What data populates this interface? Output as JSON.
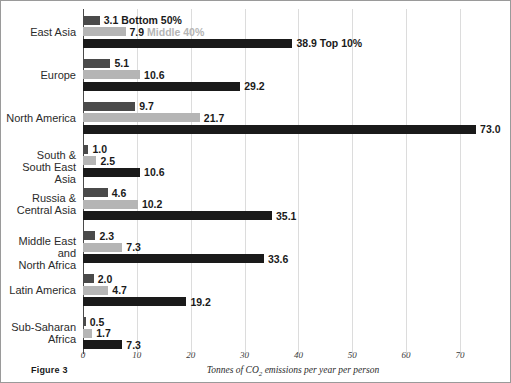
{
  "figure": {
    "caption": "Figure 3",
    "x_axis_title_prefix": "Tonnes of CO",
    "x_axis_title_sub": "2",
    "x_axis_title_suffix": " emissions per year per person"
  },
  "legend": {
    "bottom_label": "Bottom 50%",
    "middle_label": "Middle 40%",
    "top_label": "Top 10%",
    "bottom_color": "#4a4a4a",
    "middle_color": "#b5b5b5",
    "top_color": "#1a1a1a"
  },
  "chart_data": {
    "type": "bar",
    "orientation": "horizontal",
    "title": "",
    "xlabel": "Tonnes of CO2 emissions per year per person",
    "ylabel": "",
    "xlim": [
      0,
      78
    ],
    "xticks": [
      0,
      10,
      20,
      30,
      40,
      50,
      60,
      70
    ],
    "xtick_labels": [
      "0",
      "10",
      "20",
      "30",
      "40",
      "50",
      "60",
      "70"
    ],
    "grid": true,
    "legend_position": "inline-top-first-group",
    "categories": [
      "East Asia",
      "Europe",
      "North America",
      "South &\nSouth East Asia",
      "Russia &\nCentral Asia",
      "Middle East and\nNorth Africa",
      "Latin America",
      "Sub-Saharan\nAfrica"
    ],
    "series": [
      {
        "name": "Bottom 50%",
        "color": "#4a4a4a",
        "values": [
          3.1,
          5.1,
          9.7,
          1.0,
          4.6,
          2.3,
          2.0,
          0.5
        ],
        "labels": [
          "3.1",
          "5.1",
          "9.7",
          "1.0",
          "4.6",
          "2.3",
          "2.0",
          "0.5"
        ]
      },
      {
        "name": "Middle 40%",
        "color": "#b5b5b5",
        "values": [
          7.9,
          10.6,
          21.7,
          2.5,
          10.2,
          7.3,
          4.7,
          1.7
        ],
        "labels": [
          "7.9",
          "10.6",
          "21.7",
          "2.5",
          "10.2",
          "7.3",
          "4.7",
          "1.7"
        ]
      },
      {
        "name": "Top 10%",
        "color": "#1a1a1a",
        "values": [
          38.9,
          29.2,
          73.0,
          10.6,
          35.1,
          33.6,
          19.2,
          7.3
        ],
        "labels": [
          "38.9",
          "29.2",
          "73.0",
          "10.6",
          "35.1",
          "33.6",
          "19.2",
          "7.3"
        ]
      }
    ]
  }
}
